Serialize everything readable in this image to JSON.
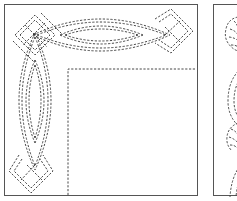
{
  "figure": {
    "panels": [
      {
        "id": "left",
        "motif": "celtic-knot-corner-border",
        "description": "Interlaced Celtic knot border along top and left edges with dashed inner corner line"
      },
      {
        "id": "right",
        "motif": "feather-plume-border",
        "description": "Feather/leaf plume quilting motif with dashed arcs, cropped at right edge"
      }
    ],
    "colors": {
      "stitch": "#333333",
      "frame": "#555555",
      "background": "#ffffff"
    }
  }
}
